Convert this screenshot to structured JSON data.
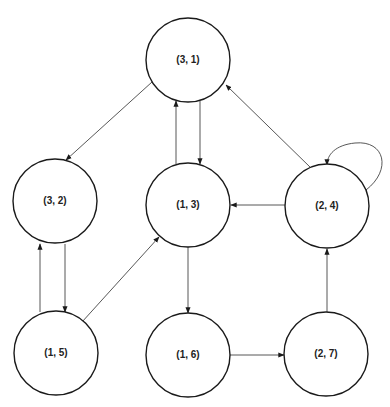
{
  "diagram": {
    "type": "directed-graph",
    "colors": {
      "node_stroke": "#1a1a1a",
      "edge_stroke": "#444444",
      "background": "#ffffff"
    },
    "nodes": [
      {
        "id": "n31",
        "label": "(3, 1)",
        "cx": 188,
        "cy": 60,
        "r": 42
      },
      {
        "id": "n32",
        "label": "(3, 2)",
        "cx": 55,
        "cy": 201,
        "r": 42
      },
      {
        "id": "n13",
        "label": "(1, 3)",
        "cx": 188,
        "cy": 205,
        "r": 42
      },
      {
        "id": "n24",
        "label": "(2, 4)",
        "cx": 327,
        "cy": 206,
        "r": 42
      },
      {
        "id": "n15",
        "label": "(1, 5)",
        "cx": 56,
        "cy": 353,
        "r": 42
      },
      {
        "id": "n16",
        "label": "(1, 6)",
        "cx": 188,
        "cy": 355,
        "r": 42
      },
      {
        "id": "n27",
        "label": "(2, 7)",
        "cx": 326,
        "cy": 354,
        "r": 42
      }
    ],
    "edges": [
      {
        "from": "(3, 1)",
        "to": "(3, 2)",
        "path": "M152,82 L66,160"
      },
      {
        "from": "(1, 3)",
        "to": "(3, 1)",
        "path": "M176,164 L176,101"
      },
      {
        "from": "(3, 1)",
        "to": "(1, 3)",
        "path": "M200,101 L200,164"
      },
      {
        "from": "(2, 4)",
        "to": "(3, 1)",
        "path": "M311,168 L226,85"
      },
      {
        "from": "(2, 4)",
        "to": "(1, 3)",
        "path": "M285,205 L231,205"
      },
      {
        "from": "(2, 4)",
        "to": "(2, 4)",
        "path": "M366,190 C392,170 385,140 355,143 C335,145 327,155 327,165"
      },
      {
        "from": "(1, 5)",
        "to": "(3, 2)",
        "path": "M40,312 L40,244"
      },
      {
        "from": "(3, 2)",
        "to": "(1, 5)",
        "path": "M65,244 L65,312"
      },
      {
        "from": "(1, 5)",
        "to": "(1, 3)",
        "path": "M82,322 L159,237"
      },
      {
        "from": "(1, 3)",
        "to": "(1, 6)",
        "path": "M188,247 L188,313"
      },
      {
        "from": "(1, 6)",
        "to": "(2, 7)",
        "path": "M230,355 L284,355"
      },
      {
        "from": "(2, 7)",
        "to": "(2, 4)",
        "path": "M327,312 L327,249"
      }
    ]
  }
}
